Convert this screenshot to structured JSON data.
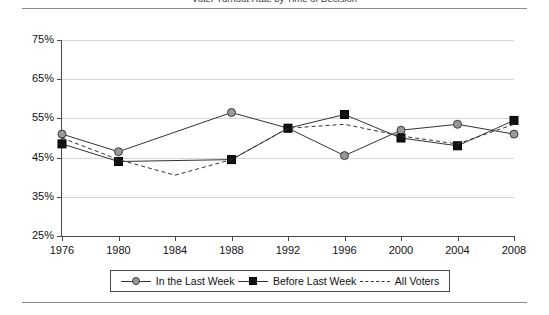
{
  "figure": {
    "caption_clipped": "Voter Turnout Rate by Time of Decision"
  },
  "legend": {
    "position": "bottom-center",
    "entries": [
      {
        "label": "In the Last Week",
        "marker": "circle-marker",
        "line": "solid",
        "color": "#999999"
      },
      {
        "label": "Before Last Week",
        "marker": "square-marker",
        "line": "solid",
        "color": "#111111"
      },
      {
        "label": "All Voters",
        "marker": "none",
        "line": "dashed",
        "color": "#333333"
      }
    ]
  },
  "chart_data": {
    "type": "line",
    "title": "",
    "xlabel": "",
    "ylabel": "",
    "grid": true,
    "ylim": [
      25,
      75
    ],
    "yticks": [
      25,
      35,
      45,
      55,
      65,
      75
    ],
    "ytick_labels": [
      "25%",
      "35%",
      "45%",
      "55%",
      "65%",
      "75%"
    ],
    "x": [
      1976,
      1980,
      1984,
      1988,
      1992,
      1996,
      2000,
      2004,
      2008
    ],
    "xtick_labels": [
      "1976",
      "1980",
      "1984",
      "1988",
      "1992",
      "1996",
      "2000",
      "2004",
      "2008"
    ],
    "series": [
      {
        "name": "In the Last Week",
        "marker": "circle",
        "line": "solid",
        "color": "#999999",
        "values": [
          51.0,
          46.5,
          null,
          56.5,
          52.5,
          45.5,
          52.0,
          53.5,
          51.0
        ]
      },
      {
        "name": "Before Last Week",
        "marker": "square",
        "line": "solid",
        "color": "#111111",
        "values": [
          48.5,
          44.0,
          null,
          44.5,
          52.5,
          56.0,
          50.0,
          48.0,
          54.5
        ]
      },
      {
        "name": "All Voters",
        "marker": "none",
        "line": "dashed",
        "color": "#333333",
        "values": [
          50.0,
          44.5,
          40.5,
          44.5,
          52.5,
          53.5,
          50.5,
          48.5,
          53.5
        ]
      }
    ]
  }
}
